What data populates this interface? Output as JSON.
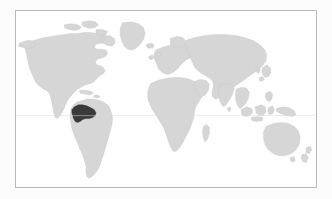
{
  "map": {
    "kind": "world-locator-map",
    "projection": "equirectangular",
    "title": "World locator map",
    "highlighted_country": "Colombia",
    "highlight_region": "northwestern South America",
    "colors": {
      "page_background": "#fcfcfc",
      "ocean": "#ffffff",
      "land_fill": "#d6d6d6",
      "land_stroke": "#c4c4c4",
      "highlight_fill": "#3a3a3a",
      "frame_border": "#b9b9b9",
      "graticule": "#d9d9d9"
    },
    "frame": {
      "left": 15,
      "top": 10,
      "width": 302,
      "height": 178,
      "border_width": 1
    },
    "graticules": [
      {
        "name": "equator",
        "latitude": 0,
        "label": ""
      }
    ],
    "landmasses": [
      {
        "name": "North America"
      },
      {
        "name": "South America"
      },
      {
        "name": "Greenland"
      },
      {
        "name": "Europe"
      },
      {
        "name": "Africa"
      },
      {
        "name": "Asia"
      },
      {
        "name": "Australia"
      },
      {
        "name": "Madagascar"
      },
      {
        "name": "Japan"
      },
      {
        "name": "New Zealand"
      },
      {
        "name": "British Isles"
      },
      {
        "name": "Indonesia"
      },
      {
        "name": "Philippines"
      },
      {
        "name": "New Guinea"
      },
      {
        "name": "Iceland"
      },
      {
        "name": "Sri Lanka"
      },
      {
        "name": "Cuba"
      },
      {
        "name": "Borneo"
      }
    ]
  }
}
